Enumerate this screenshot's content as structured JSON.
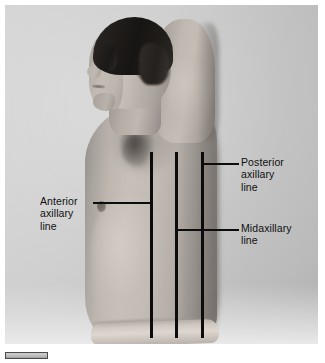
{
  "figure": {
    "type": "anatomical-reference-photo",
    "view": "left lateral profile, subject facing left",
    "subject": {
      "pose": "standing, right arm raised above and behind the head",
      "attire": "bare torso with light waistband at hip",
      "hair": "short dark hair"
    },
    "background_color": "#c6c0ba",
    "line_color": "#0c0c0c",
    "label_color": "#101010"
  },
  "reference_lines": [
    {
      "id": "anterior-axillary-line",
      "label": "Anterior\naxillary\nline",
      "label_side": "left",
      "x_position": 150,
      "top": 152,
      "bottom": 338,
      "leader_y": 202
    },
    {
      "id": "midaxillary-line",
      "label": "Midaxillary\nline",
      "label_side": "right",
      "x_position": 175,
      "top": 152,
      "bottom": 338,
      "leader_y": 229
    },
    {
      "id": "posterior-axillary-line",
      "label": "Posterior\naxillary\nline",
      "label_side": "right",
      "x_position": 201,
      "top": 152,
      "bottom": 338,
      "leader_y": 163
    }
  ],
  "caption_bar": {
    "present": true,
    "text": ""
  }
}
